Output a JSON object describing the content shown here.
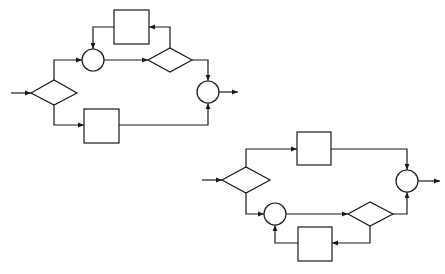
{
  "diagram": {
    "type": "flow-block-diagram",
    "stroke_color": "#1a1a1a",
    "background": "#ffffff",
    "figures": [
      {
        "id": "top",
        "nodes": [
          {
            "id": "d1",
            "kind": "decision",
            "cx": 54,
            "cy": 93,
            "w": 46,
            "h": 25
          },
          {
            "id": "s1",
            "kind": "junction",
            "cx": 93,
            "cy": 60,
            "r": 11
          },
          {
            "id": "b1",
            "kind": "block",
            "x": 114,
            "y": 10,
            "w": 35,
            "h": 34
          },
          {
            "id": "d2",
            "kind": "decision",
            "cx": 170,
            "cy": 60,
            "w": 44,
            "h": 24
          },
          {
            "id": "b2",
            "kind": "block",
            "x": 84,
            "y": 109,
            "w": 35,
            "h": 34
          },
          {
            "id": "s2",
            "kind": "junction",
            "cx": 208,
            "cy": 92,
            "r": 11
          }
        ]
      },
      {
        "id": "bottom",
        "nodes": [
          {
            "id": "d3",
            "kind": "decision",
            "cx": 246,
            "cy": 180,
            "w": 48,
            "h": 26
          },
          {
            "id": "b3",
            "kind": "block",
            "x": 297,
            "y": 132,
            "w": 34,
            "h": 33
          },
          {
            "id": "s3",
            "kind": "junction",
            "cx": 275,
            "cy": 214,
            "r": 11
          },
          {
            "id": "d4",
            "kind": "decision",
            "cx": 370,
            "cy": 214,
            "w": 45,
            "h": 24
          },
          {
            "id": "b4",
            "kind": "block",
            "x": 298,
            "y": 227,
            "w": 34,
            "h": 34
          },
          {
            "id": "s4",
            "kind": "junction",
            "cx": 407,
            "cy": 181,
            "r": 11
          }
        ]
      }
    ]
  }
}
